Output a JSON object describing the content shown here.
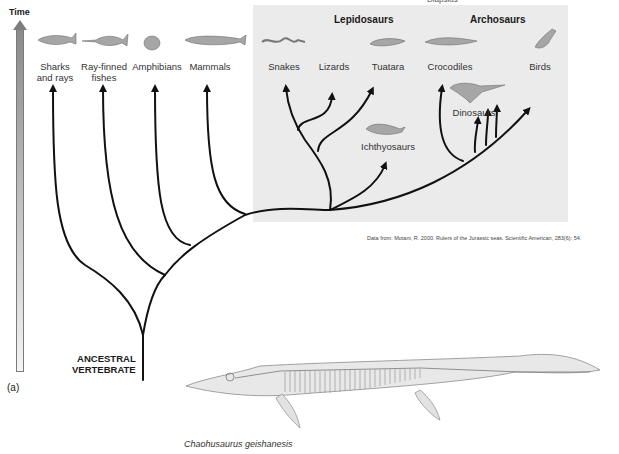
{
  "figure": {
    "panel_label": "(a)",
    "time_axis_label": "Time",
    "root_label_line1": "ANCESTRAL",
    "root_label_line2": "VERTEBRATE",
    "top_cut_label": "Diapsids",
    "citation": "Data from: Motani, R. 2000. Rulers of the Jurassic seas. Scientific American, 283(6): 54.",
    "specimen_caption": "Chaohusaurus geishanesis"
  },
  "groups": {
    "lepidosaurs": "Lepidosaurs",
    "archosaurs": "Archosaurs"
  },
  "taxa": {
    "sharks": {
      "line1": "Sharks",
      "line2": "and rays"
    },
    "rayfinned": {
      "line1": "Ray-finned",
      "line2": "fishes"
    },
    "amphibians": {
      "line1": "Amphibians"
    },
    "mammals": {
      "line1": "Mammals"
    },
    "snakes": {
      "line1": "Snakes"
    },
    "lizards": {
      "line1": "Lizards"
    },
    "tuatara": {
      "line1": "Tuatara"
    },
    "crocodiles": {
      "line1": "Crocodiles"
    },
    "birds": {
      "line1": "Birds"
    },
    "dinosaurs": {
      "line1": "Dinosaurs"
    },
    "ichthyosaurs": {
      "line1": "Ichthyosaurs"
    }
  },
  "colors": {
    "shaded_region": "#ebebeb",
    "branch": "#111111",
    "animal_fill": "#9a9a9a"
  }
}
